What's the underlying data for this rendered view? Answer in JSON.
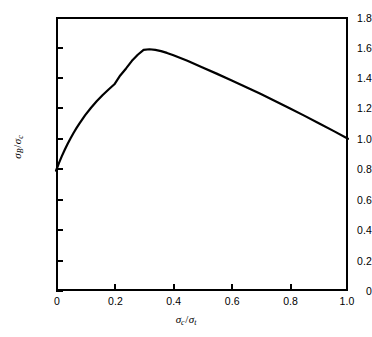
{
  "chart_data": {
    "type": "line",
    "title": "",
    "subtitle": "",
    "xlabel_parts": {
      "num_symbol": "σ",
      "num_sub": "c",
      "den_symbol": "σ",
      "den_sub": "t"
    },
    "ylabel_parts": {
      "num_symbol": "σ",
      "num_sub": "B",
      "den_symbol": "σ",
      "den_sub": "c"
    },
    "xlabel": "σc/σt",
    "ylabel": "σB/σc",
    "xlim": [
      0,
      1.0
    ],
    "ylim": [
      0,
      1.8
    ],
    "xticks": [
      "0",
      "0.2",
      "0.4",
      "0.6",
      "0.8",
      "1.0"
    ],
    "xtick_values": [
      0,
      0.2,
      0.4,
      0.6,
      0.8,
      1.0
    ],
    "yticks": [
      "0",
      "0.2",
      "0.4",
      "0.6",
      "0.8",
      "1.0",
      "1.2",
      "1.4",
      "1.6",
      "1.8"
    ],
    "ytick_values": [
      0,
      0.2,
      0.4,
      0.6,
      0.8,
      1.0,
      1.2,
      1.4,
      1.6,
      1.8
    ],
    "grid": false,
    "legend": null,
    "legend_position": "none",
    "line_color": "#000000",
    "line_width": 2,
    "frame_color": "#000000",
    "background_color": "#ffffff",
    "annotations": [],
    "series": [
      {
        "name": "sigma_B over sigma_c",
        "x": [
          0.0,
          0.01,
          0.02,
          0.03,
          0.04,
          0.05,
          0.06,
          0.07,
          0.08,
          0.09,
          0.1,
          0.12,
          0.14,
          0.16,
          0.18,
          0.2,
          0.22,
          0.24,
          0.26,
          0.28,
          0.3,
          0.32,
          0.34,
          0.36,
          0.38,
          0.4,
          0.45,
          0.5,
          0.55,
          0.6,
          0.65,
          0.7,
          0.75,
          0.8,
          0.85,
          0.9,
          0.95,
          1.0
        ],
        "y": [
          0.79,
          0.84,
          0.886,
          0.928,
          0.968,
          1.004,
          1.038,
          1.07,
          1.1,
          1.128,
          1.155,
          1.204,
          1.248,
          1.288,
          1.324,
          1.358,
          1.416,
          1.462,
          1.512,
          1.552,
          1.584,
          1.588,
          1.584,
          1.576,
          1.564,
          1.55,
          1.512,
          1.47,
          1.428,
          1.385,
          1.34,
          1.295,
          1.248,
          1.2,
          1.152,
          1.102,
          1.052,
          1.0
        ]
      }
    ],
    "peak": {
      "x": 0.31,
      "y": 1.59
    },
    "start_point": {
      "x": 0.0,
      "y": 0.79
    },
    "end_point": {
      "x": 1.0,
      "y": 1.0
    }
  }
}
